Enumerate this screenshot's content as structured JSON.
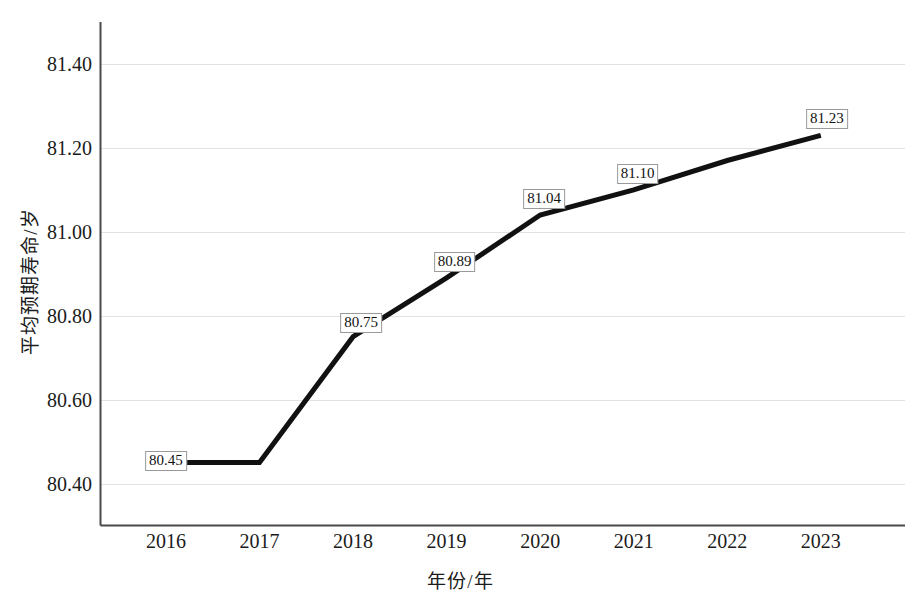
{
  "chart_data": {
    "type": "line",
    "title": "",
    "xlabel": "年份/年",
    "ylabel": "平均预期寿命/岁",
    "categories": [
      "2016",
      "2017",
      "2018",
      "2019",
      "2020",
      "2021",
      "2022",
      "2023"
    ],
    "x": [
      2016,
      2017,
      2018,
      2019,
      2020,
      2021,
      2022,
      2023
    ],
    "values": [
      80.45,
      80.45,
      80.75,
      80.89,
      81.04,
      81.1,
      81.17,
      81.23
    ],
    "point_labels": [
      "80.45",
      "",
      "80.75",
      "80.89",
      "81.04",
      "81.10",
      "",
      "81.23"
    ],
    "point_labels_visible": [
      true,
      false,
      true,
      true,
      true,
      true,
      false,
      true
    ],
    "xlim": [
      2015.3,
      2023.9
    ],
    "ylim": [
      80.3,
      81.5
    ],
    "yticks": [
      80.4,
      80.6,
      80.8,
      81.0,
      81.2,
      81.4
    ],
    "ytick_labels": [
      "80.40",
      "80.60",
      "80.80",
      "81.00",
      "81.20",
      "81.40"
    ],
    "grid": "horizontal",
    "legend": "none",
    "series_name": "平均预期寿命",
    "line_color": "#111111",
    "grid_color": "#e2e2e2",
    "axis_color": "#4a4a4a",
    "background_color": "#ffffff",
    "line_width": 5
  }
}
